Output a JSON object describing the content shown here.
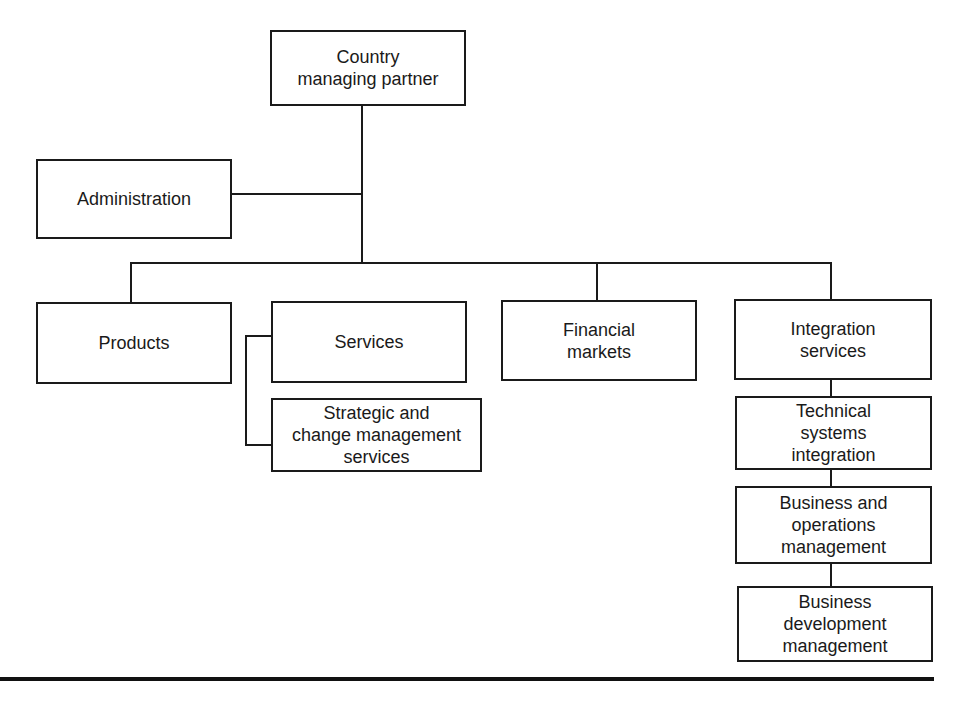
{
  "diagram": {
    "type": "org-chart",
    "nodes": [
      {
        "id": "country",
        "label": "Country\nmanaging partner"
      },
      {
        "id": "admin",
        "label": "Administration"
      },
      {
        "id": "products",
        "label": "Products"
      },
      {
        "id": "services",
        "label": "Services"
      },
      {
        "id": "strategic",
        "label": "Strategic and\nchange management\nservices"
      },
      {
        "id": "financial",
        "label": "Financial\nmarkets"
      },
      {
        "id": "integration",
        "label": "Integration\nservices"
      },
      {
        "id": "technical",
        "label": "Technical\nsystems\nintegration"
      },
      {
        "id": "busops",
        "label": "Business and\noperations\nmanagement"
      },
      {
        "id": "busdev",
        "label": "Business\ndevelopment\nmanagement"
      }
    ],
    "edges": [
      [
        "country",
        "admin"
      ],
      [
        "country",
        "products"
      ],
      [
        "country",
        "services"
      ],
      [
        "country",
        "financial"
      ],
      [
        "country",
        "integration"
      ],
      [
        "services",
        "strategic"
      ],
      [
        "integration",
        "technical"
      ],
      [
        "technical",
        "busops"
      ],
      [
        "busops",
        "busdev"
      ]
    ]
  }
}
